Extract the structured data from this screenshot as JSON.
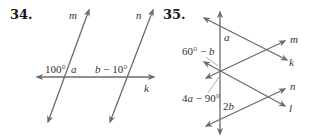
{
  "problems": [
    {
      "number": "34.",
      "lines": {
        "m": "m",
        "n": "n",
        "k": "k"
      },
      "angles": {
        "left_of_m": "100°",
        "right_of_m": "a",
        "left_of_n": "b − 10°"
      },
      "geometry": {
        "m": [
          [
            48,
            122
          ],
          [
            89,
            10
          ]
        ],
        "n": [
          [
            110,
            122
          ],
          [
            153,
            10
          ]
        ],
        "k": [
          [
            37,
            77
          ],
          [
            154,
            77
          ]
        ]
      }
    },
    {
      "number": "35.",
      "lines": {
        "m": "m",
        "k": "k",
        "n": "n",
        "l": "l"
      },
      "angles": {
        "top": "a",
        "upper_left": "60° − b",
        "lower_left": "4a − 90°",
        "bottom": "2b"
      },
      "geometry": {
        "vertical": [
          [
            220,
            134
          ],
          [
            220,
            12
          ]
        ],
        "k": [
          [
            204,
            18
          ],
          [
            287,
            60
          ]
        ],
        "m": [
          [
            206,
            78
          ],
          [
            285,
            41
          ]
        ],
        "l": [
          [
            204,
            62
          ],
          [
            285,
            106
          ]
        ],
        "n": [
          [
            206,
            126
          ],
          [
            285,
            89
          ]
        ]
      }
    }
  ],
  "colors": {
    "line": "#6b6b6b",
    "text": "#333333",
    "number": "#1a1a1a"
  }
}
